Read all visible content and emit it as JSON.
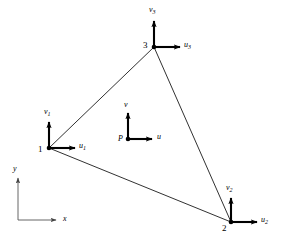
{
  "figure": {
    "background_color": "#ffffff",
    "line_color": "#1a1a1a",
    "arrow_color": "#000000"
  },
  "nodes": [
    {
      "id": "1",
      "label": "1",
      "x": 49,
      "y": 148,
      "label_x": 39,
      "label_y": 149,
      "u_label": "u",
      "u_sub": "1",
      "u_label_x": 80,
      "u_label_y": 144,
      "v_label": "v",
      "v_sub": "1",
      "v_label_x": 44,
      "v_label_y": 108,
      "u_arrow_len": 30,
      "v_arrow_len": 29
    },
    {
      "id": "2",
      "label": "2",
      "x": 231,
      "y": 222,
      "label_x": 222,
      "label_y": 226,
      "u_label": "u",
      "u_sub": "2",
      "u_label_x": 262,
      "u_label_y": 218,
      "v_label": "v",
      "v_sub": "2",
      "v_label_x": 227,
      "v_label_y": 184,
      "u_arrow_len": 30,
      "v_arrow_len": 27
    },
    {
      "id": "3",
      "label": "3",
      "x": 154,
      "y": 47,
      "label_x": 143,
      "label_y": 45,
      "u_label": "u",
      "u_sub": "3",
      "u_label_x": 184,
      "u_label_y": 42,
      "v_label": "v",
      "v_sub": "3",
      "v_label_x": 149,
      "v_label_y": 7,
      "u_arrow_len": 30,
      "v_arrow_len": 30
    }
  ],
  "interior_point": {
    "label": "P",
    "x": 128,
    "y": 139,
    "label_x": 118,
    "label_y": 138,
    "u_label": "u",
    "u_label_x": 158,
    "u_label_y": 135,
    "v_label": "v",
    "v_label_x": 124,
    "v_label_y": 103,
    "u_arrow_len": 28,
    "v_arrow_len": 30
  },
  "axes": {
    "origin_x": 18,
    "origin_y": 220,
    "x_axis_length": 42,
    "y_axis_length": 46,
    "x_label": "x",
    "x_label_x": 64,
    "x_label_y": 217,
    "y_label": "y",
    "y_label_x": 13,
    "y_label_y": 164
  },
  "edges": [
    {
      "name": "edge-1-3",
      "from": "1",
      "to": "3"
    },
    {
      "name": "edge-3-2",
      "from": "3",
      "to": "2"
    },
    {
      "name": "edge-1-2",
      "from": "1",
      "to": "2"
    }
  ]
}
